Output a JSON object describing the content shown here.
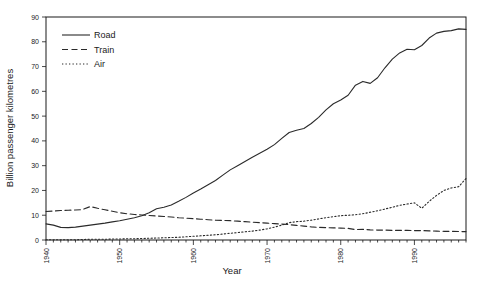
{
  "chart_data": {
    "type": "line",
    "title": "",
    "xlabel": "Year",
    "ylabel": "Billion passenger kilometres",
    "xlim": [
      1940,
      1997
    ],
    "ylim": [
      0,
      90
    ],
    "ytick_step": 10,
    "xtick_step": 10,
    "grid": false,
    "legend_position": "top-left",
    "yticks": [
      "0",
      "10",
      "20",
      "30",
      "40",
      "50",
      "60",
      "70",
      "80",
      "90"
    ],
    "xticks": [
      "1940",
      "1950",
      "1960",
      "1970",
      "1980",
      "1990"
    ],
    "x": [
      1940,
      1941,
      1942,
      1943,
      1944,
      1945,
      1946,
      1947,
      1948,
      1949,
      1950,
      1951,
      1952,
      1953,
      1954,
      1955,
      1956,
      1957,
      1958,
      1959,
      1960,
      1961,
      1962,
      1963,
      1964,
      1965,
      1966,
      1967,
      1968,
      1969,
      1970,
      1971,
      1972,
      1973,
      1974,
      1975,
      1976,
      1977,
      1978,
      1979,
      1980,
      1981,
      1982,
      1983,
      1984,
      1985,
      1986,
      1987,
      1988,
      1989,
      1990,
      1991,
      1992,
      1993,
      1994,
      1995,
      1996,
      1997
    ],
    "series": [
      {
        "name": "Road",
        "style": "solid",
        "values": [
          6.5,
          6.0,
          5.1,
          5.0,
          5.2,
          5.6,
          6.0,
          6.4,
          6.8,
          7.3,
          7.8,
          8.4,
          9.0,
          9.8,
          11.0,
          12.6,
          13.2,
          14.1,
          15.6,
          17.2,
          19.0,
          20.6,
          22.3,
          24.0,
          26.2,
          28.3,
          30.0,
          31.7,
          33.4,
          35.0,
          36.6,
          38.5,
          41.0,
          43.4,
          44.3,
          45.0,
          47.0,
          49.5,
          52.5,
          55.0,
          56.5,
          58.4,
          62.5,
          64.0,
          63.2,
          65.5,
          69.5,
          73.0,
          75.5,
          77.0,
          76.8,
          78.5,
          81.5,
          83.5,
          84.2,
          84.5,
          85.2,
          85.0
        ]
      },
      {
        "name": "Train",
        "style": "dashed",
        "values": [
          11.5,
          11.7,
          11.9,
          12.0,
          12.1,
          12.3,
          13.5,
          12.8,
          12.2,
          11.6,
          11.0,
          10.6,
          10.3,
          10.1,
          9.9,
          9.7,
          9.5,
          9.3,
          9.0,
          8.8,
          8.6,
          8.4,
          8.2,
          8.0,
          7.9,
          7.8,
          7.6,
          7.4,
          7.2,
          7.0,
          6.8,
          6.6,
          6.4,
          6.2,
          5.9,
          5.6,
          5.3,
          5.1,
          5.0,
          4.9,
          4.8,
          4.7,
          4.2,
          4.3,
          4.1,
          4.0,
          4.0,
          3.9,
          3.9,
          3.9,
          3.8,
          3.8,
          3.7,
          3.6,
          3.5,
          3.5,
          3.4,
          3.4
        ]
      },
      {
        "name": "Air",
        "style": "dotted",
        "values": [
          0.1,
          0.1,
          0.1,
          0.1,
          0.1,
          0.2,
          0.3,
          0.3,
          0.3,
          0.4,
          0.4,
          0.5,
          0.5,
          0.6,
          0.7,
          0.8,
          0.9,
          1.0,
          1.1,
          1.3,
          1.5,
          1.7,
          1.9,
          2.1,
          2.4,
          2.7,
          3.0,
          3.3,
          3.6,
          4.0,
          4.5,
          5.2,
          6.0,
          7.0,
          7.4,
          7.6,
          8.0,
          8.5,
          9.0,
          9.4,
          9.8,
          10.0,
          10.2,
          10.6,
          11.2,
          11.8,
          12.5,
          13.2,
          14.0,
          14.5,
          15.0,
          12.8,
          15.6,
          18.0,
          20.0,
          21.0,
          21.5,
          24.8
        ]
      }
    ]
  },
  "legend": {
    "items": [
      {
        "label": "Road"
      },
      {
        "label": "Train"
      },
      {
        "label": "Air"
      }
    ]
  }
}
